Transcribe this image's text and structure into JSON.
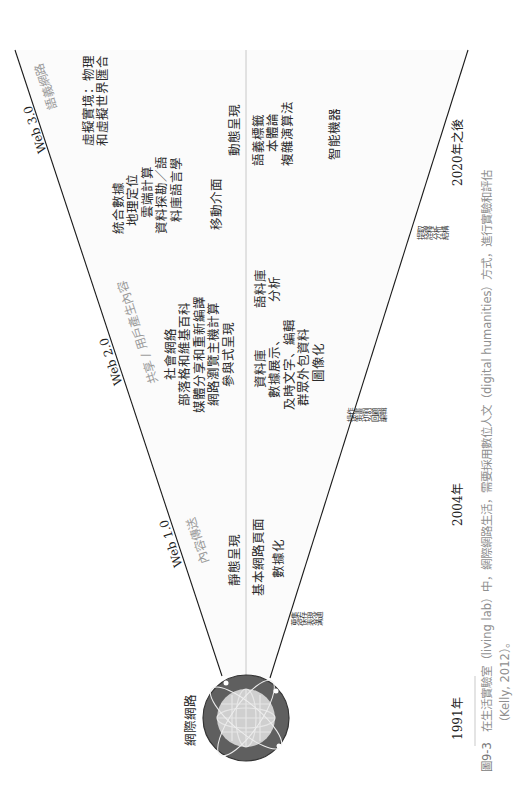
{
  "diagram": {
    "origin_label": "網際網路",
    "stages": [
      {
        "name": "Web 1.0",
        "theme": "內容傳送",
        "upper_items": [
          "靜態呈現",
          "基本網路頁面",
          "數據化"
        ],
        "lower_items": [],
        "activities": [
          "蒐集",
          "保存",
          "表現",
          "溝通"
        ]
      },
      {
        "name": "Web 2.0",
        "theme": "共享 / 用戶產生內容",
        "upper_items": [
          "社會網絡",
          "部落格和維基百科",
          "媒體分享和重新編譯",
          "網路瀏覽主機計算",
          "參與式呈現"
        ],
        "lower_items": [
          "資料庫",
          "數據展示、",
          "及時文字、編輯",
          "群眾外包資料",
          "圖像化"
        ],
        "lower_items_2": [
          "語料庫",
          "分析"
        ],
        "activities": [
          "操作",
          "策畫",
          "切割",
          "回顧",
          "編輯"
        ]
      },
      {
        "name": "Web 3.0",
        "theme": "語義網路",
        "upper_items": [
          "虛擬實境：物理",
          "和虛擬世界匯合"
        ],
        "upper_items_2": [
          "統合數據",
          "地理定位",
          "雲端計算",
          "資料探勘／語",
          "料庫語言學"
        ],
        "upper_items_3": [
          "移動介面"
        ],
        "upper_items_4": [
          "動態呈現"
        ],
        "lower_items": [
          "語義標籤",
          "本體論",
          "複雜演算法"
        ],
        "lower_items_2": [
          "智能機器"
        ],
        "activities": [
          "提取",
          "詮釋",
          "分析",
          "結構"
        ]
      }
    ],
    "timeline": [
      "1991年",
      "2004年",
      "2020年之後"
    ]
  },
  "caption": {
    "figure_no": "圖9-3",
    "line1": "在生活實驗室（living lab）中，網際網路生活，需要採用數位人文（digital humanities）方式，進行實驗和評估",
    "line2": "（Kelly, 2012）。"
  },
  "colors": {
    "line": "#1a1a1a",
    "divider": "#c8c8c8",
    "theme_text": "#9a9a9a",
    "globe_outer": "#5a5a5a",
    "globe_inner": "#c9c9c9"
  }
}
